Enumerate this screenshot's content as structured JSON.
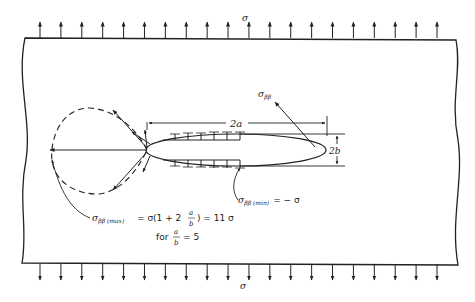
{
  "figure": {
    "applied_stress_top": "σ",
    "applied_stress_bottom": "σ",
    "top_arrow_count": 20,
    "bottom_arrow_count": 20,
    "dimension_major": "2a",
    "dimension_minor": "2b",
    "tangential_stress_label": "σ",
    "tangential_stress_subscript": "ββ",
    "min_stress_label": "σ",
    "min_stress_subscript": "ββ (min)",
    "min_stress_value": "= − σ",
    "max_stress_label": "σ",
    "max_stress_subscript": "ββ (max)",
    "max_stress_expr_prefix": "= σ(1 + 2",
    "max_stress_frac_num": "a",
    "max_stress_frac_den": "b",
    "max_stress_expr_suffix": ") = 11 σ",
    "condition_prefix": "for",
    "condition_frac_num": "a",
    "condition_frac_den": "b",
    "condition_suffix": "= 5"
  }
}
